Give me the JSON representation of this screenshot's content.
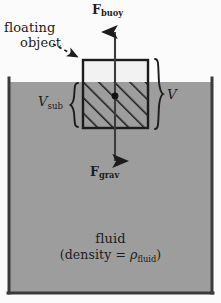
{
  "diagram": {
    "forces": {
      "buoyant": {
        "symbol": "F",
        "subscript": "buoy",
        "direction": "up"
      },
      "gravity": {
        "symbol": "F",
        "subscript": "grav",
        "direction": "down"
      }
    },
    "annotations": {
      "object_line1": "floating",
      "object_line2": "object",
      "volume_total_symbol": "V",
      "volume_sub_symbol": "V",
      "volume_sub_subscript": "sub"
    },
    "fluid": {
      "name": "fluid",
      "density_prefix": "(density = ",
      "density_symbol": "ρ",
      "density_subscript": "fluid",
      "density_suffix": ")"
    },
    "colors": {
      "fluid_fill": "#9d9d9d",
      "background": "#fbfbfb",
      "ink": "#1c1c1c",
      "object_top_fill": "#f2f2f2",
      "wall": "#3a3a3a"
    },
    "geometry": {
      "container_left_x": 8,
      "container_right_x": 212,
      "container_bottom_y": 293,
      "fluid_surface_y": 82,
      "box_left_x": 83,
      "box_right_x": 148,
      "box_top_y": 60,
      "box_bottom_y": 128,
      "arrow_axis_x": 115,
      "buoy_arrow_tip_y": 30,
      "grav_arrow_tip_y": 163,
      "center_dot": [
        115,
        96
      ]
    }
  }
}
